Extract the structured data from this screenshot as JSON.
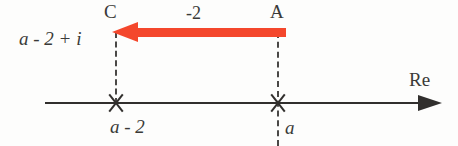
{
  "figure": {
    "type": "complex-plane-translation-diagram",
    "background_color": "#fdfdfc",
    "ink_color": "#312f2d",
    "accent_color": "#f4472c",
    "axis": {
      "name": "real-axis",
      "label": "Re",
      "arrow_direction": "right"
    },
    "points": [
      {
        "id": "A",
        "label": "A",
        "axis_label": "a",
        "marker": "x"
      },
      {
        "id": "C",
        "label": "C",
        "axis_label": "a - 2",
        "value_label": "a - 2 + i",
        "marker": "x"
      }
    ],
    "translation": {
      "label": "-2",
      "direction": "left",
      "from": "A",
      "to": "C",
      "color": "#f4472c"
    }
  }
}
